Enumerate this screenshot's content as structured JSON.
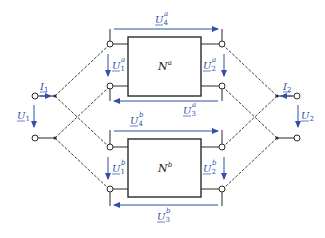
{
  "diagram": {
    "type": "two-port parallel-parallel interconnection circuit",
    "colors": {
      "wire": "#2a2a2a",
      "arrow": "#2f4fa8",
      "label": "#2f4fa8"
    },
    "blocks": [
      {
        "id": "Na",
        "name": "N",
        "sup": "a"
      },
      {
        "id": "Nb",
        "name": "N",
        "sup": "b"
      }
    ],
    "labels": {
      "I1": {
        "base": "I",
        "sub": "1"
      },
      "U1": {
        "base": "U",
        "sub": "1"
      },
      "I2": {
        "base": "I",
        "sub": "2"
      },
      "U2": {
        "base": "U",
        "sub": "2"
      },
      "U1a": {
        "base": "U",
        "sub": "1",
        "sup": "a"
      },
      "U2a": {
        "base": "U",
        "sub": "2",
        "sup": "a"
      },
      "U3a": {
        "base": "U",
        "sub": "3",
        "sup": "a"
      },
      "U4a": {
        "base": "U",
        "sub": "4",
        "sup": "a"
      },
      "U1b": {
        "base": "U",
        "sub": "1",
        "sup": "b"
      },
      "U2b": {
        "base": "U",
        "sub": "2",
        "sup": "b"
      },
      "U3b": {
        "base": "U",
        "sub": "3",
        "sup": "b"
      },
      "U4b": {
        "base": "U",
        "sub": "4",
        "sup": "b"
      }
    }
  }
}
